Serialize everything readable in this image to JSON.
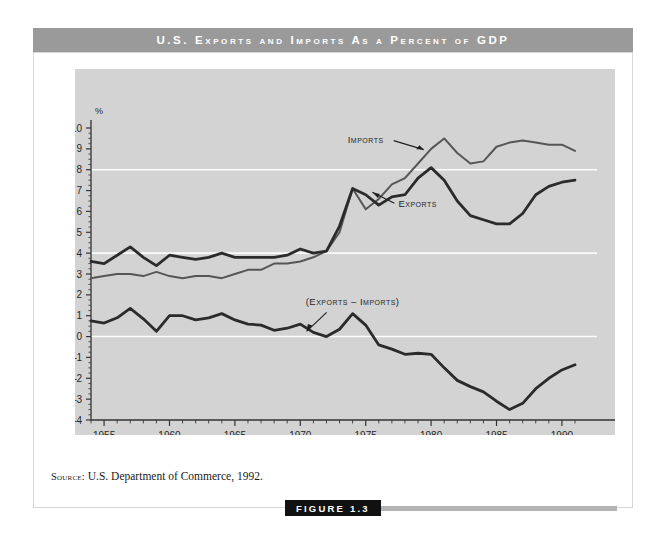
{
  "title": "U.S. Exports and Imports As a Percent of GDP",
  "source": {
    "label": "Source:",
    "text": "U.S. Department of Commerce, 1992."
  },
  "figure": {
    "caption": "FIGURE 1.3"
  },
  "colors": {
    "banner": "#9a9a9a",
    "panel": "#d3d3d3",
    "gridline": "#ffffff",
    "exports_line": "#2b2b2b",
    "imports_line": "#565656",
    "difference_line": "#2b2b2b",
    "badge": "#111111"
  },
  "chart_data": {
    "type": "line",
    "title": "U.S. Exports and Imports As a Percent of GDP",
    "xlabel": "Year",
    "ylabel": "%",
    "xlim": [
      1954,
      1991
    ],
    "ylim": [
      -4,
      10
    ],
    "yticks": [
      -4,
      -3,
      -2,
      -1,
      0,
      1,
      2,
      3,
      4,
      5,
      6,
      7,
      8,
      9,
      10
    ],
    "xticks": [
      1955,
      1960,
      1965,
      1970,
      1975,
      1980,
      1985,
      1990
    ],
    "xtick_labels": [
      "1955",
      "1960",
      "1965",
      "1970",
      "1975",
      "1980",
      "1985",
      "1990"
    ],
    "minor_xtick_interval": 1,
    "minor_ytick_interval": 0.25,
    "gridlines_y": [
      0,
      4,
      8
    ],
    "grid": true,
    "legend": "inline-annotations",
    "annotations": [
      {
        "text": "Imports",
        "x": 1975.0,
        "y": 9.3
      },
      {
        "text": "Exports",
        "x": 1977.5,
        "y": 6.2
      },
      {
        "text": "(Exports – Imports)",
        "x": 1974.0,
        "y": 1.5
      }
    ],
    "x": [
      1954,
      1955,
      1956,
      1957,
      1958,
      1959,
      1960,
      1961,
      1962,
      1963,
      1964,
      1965,
      1966,
      1967,
      1968,
      1969,
      1970,
      1971,
      1972,
      1973,
      1974,
      1975,
      1976,
      1977,
      1978,
      1979,
      1980,
      1981,
      1982,
      1983,
      1984,
      1985,
      1986,
      1987,
      1988,
      1989,
      1990,
      1991
    ],
    "series": [
      {
        "name": "Exports",
        "values": [
          3.6,
          3.5,
          3.9,
          4.3,
          3.8,
          3.4,
          3.9,
          3.8,
          3.7,
          3.8,
          4.0,
          3.8,
          3.8,
          3.8,
          3.8,
          3.9,
          4.2,
          4.0,
          4.1,
          5.3,
          7.1,
          6.8,
          6.3,
          6.7,
          6.8,
          7.6,
          8.1,
          7.5,
          6.5,
          5.8,
          5.6,
          5.4,
          5.4,
          5.9,
          6.8,
          7.2,
          7.4,
          7.5
        ]
      },
      {
        "name": "Imports",
        "values": [
          2.8,
          2.9,
          3.0,
          3.0,
          2.9,
          3.1,
          2.9,
          2.8,
          2.9,
          2.9,
          2.8,
          3.0,
          3.2,
          3.2,
          3.5,
          3.5,
          3.6,
          3.8,
          4.1,
          5.0,
          7.1,
          6.1,
          6.6,
          7.3,
          7.6,
          8.3,
          9.0,
          9.5,
          8.8,
          8.3,
          8.4,
          9.1,
          9.3,
          9.4,
          9.3,
          9.2,
          9.2,
          8.9
        ]
      },
      {
        "name": "(Exports - Imports)",
        "values": [
          0.75,
          0.65,
          0.9,
          1.35,
          0.85,
          0.25,
          1.0,
          1.0,
          0.8,
          0.9,
          1.1,
          0.8,
          0.6,
          0.55,
          0.3,
          0.4,
          0.6,
          0.2,
          0.0,
          0.35,
          1.1,
          0.55,
          -0.4,
          -0.6,
          -0.85,
          -0.8,
          -0.85,
          -1.5,
          -2.1,
          -2.4,
          -2.65,
          -3.1,
          -3.5,
          -3.2,
          -2.5,
          -2.0,
          -1.6,
          -1.35
        ]
      }
    ]
  }
}
